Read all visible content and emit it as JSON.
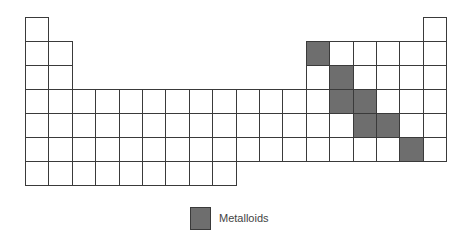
{
  "diagram": {
    "type": "periodic-table-outline",
    "grid": {
      "origin_x": 25,
      "origin_y": 17,
      "cell_width": 23.4,
      "cell_height": 24,
      "rows": [
        {
          "row": 1,
          "columns": [
            1,
            18
          ]
        },
        {
          "row": 2,
          "columns": [
            1,
            2,
            13,
            14,
            15,
            16,
            17,
            18
          ]
        },
        {
          "row": 3,
          "columns": [
            1,
            2,
            13,
            14,
            15,
            16,
            17,
            18
          ]
        },
        {
          "row": 4,
          "columns": [
            1,
            2,
            3,
            4,
            5,
            6,
            7,
            8,
            9,
            10,
            11,
            12,
            13,
            14,
            15,
            16,
            17,
            18
          ]
        },
        {
          "row": 5,
          "columns": [
            1,
            2,
            3,
            4,
            5,
            6,
            7,
            8,
            9,
            10,
            11,
            12,
            13,
            14,
            15,
            16,
            17,
            18
          ]
        },
        {
          "row": 6,
          "columns": [
            1,
            2,
            3,
            4,
            5,
            6,
            7,
            8,
            9,
            10,
            11,
            12,
            13,
            14,
            15,
            16,
            17,
            18
          ]
        },
        {
          "row": 7,
          "columns": [
            1,
            2,
            3,
            4,
            5,
            6,
            7,
            8,
            9
          ]
        }
      ],
      "highlighted": [
        {
          "row": 2,
          "col": 13
        },
        {
          "row": 3,
          "col": 14
        },
        {
          "row": 4,
          "col": 14
        },
        {
          "row": 4,
          "col": 15
        },
        {
          "row": 5,
          "col": 15
        },
        {
          "row": 5,
          "col": 16
        },
        {
          "row": 6,
          "col": 17
        }
      ]
    },
    "colors": {
      "highlight": "#6e6e6e",
      "border": "#3a3a3a",
      "background": "#ffffff"
    },
    "legend": {
      "label": "Metalloids"
    }
  }
}
